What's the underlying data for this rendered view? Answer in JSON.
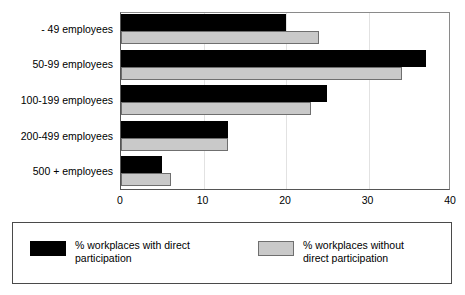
{
  "chart_data": {
    "type": "bar",
    "orientation": "horizontal",
    "title": "",
    "xlabel": "",
    "ylabel": "",
    "xlim": [
      0,
      40
    ],
    "xticks": [
      0,
      10,
      20,
      30,
      40
    ],
    "xtick_labels": [
      "0",
      "10",
      "20",
      "30",
      "40"
    ],
    "grid": true,
    "legend_position": "bottom",
    "categories": [
      "- 49 employees",
      "50-99 employees",
      "100-199 employees",
      "200-499 employees",
      "500 + employees"
    ],
    "series": [
      {
        "name": "% workplaces with direct\nparticipation",
        "color": "#000000",
        "values": [
          20,
          37,
          25,
          13,
          5
        ]
      },
      {
        "name": "% workplaces without\ndirect participation",
        "color": "#c9c9c9",
        "values": [
          24,
          34,
          23,
          13,
          6
        ]
      }
    ]
  },
  "legend": {
    "entries": [
      {
        "label": "% workplaces with direct\nparticipation",
        "swatch": "black-swatch"
      },
      {
        "label": "% workplaces without\ndirect participation",
        "swatch": "gray-swatch"
      }
    ]
  }
}
